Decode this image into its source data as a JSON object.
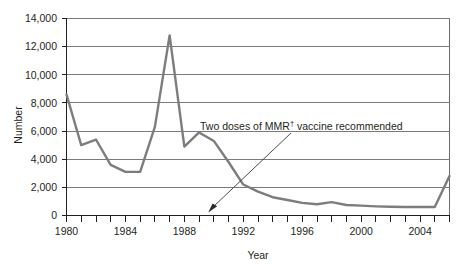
{
  "chart_data": {
    "type": "line",
    "title": "",
    "xlabel": "Year",
    "ylabel": "Number",
    "xlim": [
      1980,
      2006
    ],
    "ylim": [
      0,
      14000
    ],
    "grid": true,
    "legend": "none",
    "x": [
      1980,
      1981,
      1982,
      1983,
      1984,
      1985,
      1986,
      1987,
      1988,
      1989,
      1990,
      1991,
      1992,
      1993,
      1994,
      1995,
      1996,
      1997,
      1998,
      1999,
      2000,
      2001,
      2002,
      2003,
      2004,
      2005,
      2006
    ],
    "values": [
      8600,
      5000,
      5400,
      3600,
      3100,
      3100,
      6300,
      12800,
      4900,
      5900,
      5300,
      3800,
      2200,
      1700,
      1300,
      1100,
      900,
      800,
      950,
      750,
      700,
      650,
      620,
      600,
      600,
      600,
      2800
    ],
    "categories": [
      "1980",
      "1981",
      "1982",
      "1983",
      "1984",
      "1985",
      "1986",
      "1987",
      "1988",
      "1989",
      "1990",
      "1991",
      "1992",
      "1993",
      "1994",
      "1995",
      "1996",
      "1997",
      "1998",
      "1999",
      "2000",
      "2001",
      "2002",
      "2003",
      "2004",
      "2005",
      "2006"
    ],
    "y_ticks": [
      0,
      2000,
      4000,
      6000,
      8000,
      10000,
      12000,
      14000
    ],
    "y_tick_labels": [
      "0",
      "2,000",
      "4,000",
      "6,000",
      "8,000",
      "10,000",
      "12,000",
      "14,000"
    ],
    "x_ticks": [
      1980,
      1981,
      1982,
      1983,
      1984,
      1985,
      1986,
      1987,
      1988,
      1989,
      1990,
      1991,
      1992,
      1993,
      1994,
      1995,
      1996,
      1997,
      1998,
      1999,
      2000,
      2001,
      2002,
      2003,
      2004,
      2005,
      2006
    ],
    "x_tick_labels_shown": [
      "1980",
      "1984",
      "1988",
      "1992",
      "1996",
      "2000",
      "2004"
    ],
    "annotations": [
      {
        "text": "Two doses of MMR",
        "superscript": "†",
        "text_after": " vaccine recommended",
        "full_text": "Two doses of MMR† vaccine recommended",
        "points_to_x": 1989,
        "points_to_y": 0
      }
    ],
    "colors": {
      "series": "#7d7d7d",
      "gridline": "#7b7b7b",
      "axis": "#231f20",
      "background": "#ffffff"
    }
  },
  "axis": {
    "y_title": "Number",
    "x_title": "Year",
    "y_labels": [
      "14,000",
      "12,000",
      "10,000",
      "8,000",
      "6,000",
      "4,000",
      "2,000",
      "0"
    ],
    "x_labels": [
      "1980",
      "1984",
      "1988",
      "1992",
      "1996",
      "2000",
      "2004"
    ]
  },
  "annotation": {
    "lead": "Two doses of MMR",
    "dagger": "†",
    "tail": " vaccine recommended"
  }
}
